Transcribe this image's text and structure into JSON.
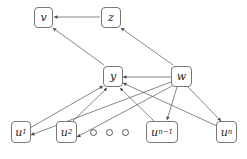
{
  "nodes": {
    "v": {
      "label": "v",
      "sub": ""
    },
    "z": {
      "label": "z",
      "sub": ""
    },
    "y": {
      "label": "y",
      "sub": ""
    },
    "w": {
      "label": "w",
      "sub": ""
    },
    "u1": {
      "label": "u",
      "sub": "1"
    },
    "u2": {
      "label": "u",
      "sub": "2"
    },
    "un1": {
      "label": "u",
      "sub": "n−1"
    },
    "un": {
      "label": "u",
      "sub": "n"
    }
  },
  "ellipsis": [
    "○",
    "○",
    "○"
  ],
  "edges": [
    {
      "from": "z",
      "to": "v"
    },
    {
      "from": "y",
      "to": "v"
    },
    {
      "from": "w",
      "to": "z"
    },
    {
      "from": "w",
      "to": "y"
    },
    {
      "from": "u1",
      "to": "y"
    },
    {
      "from": "u2",
      "to": "y"
    },
    {
      "from": "un1",
      "to": "y"
    },
    {
      "from": "un",
      "to": "y"
    },
    {
      "from": "w",
      "to": "u1"
    },
    {
      "from": "w",
      "to": "u2"
    },
    {
      "from": "w",
      "to": "un1"
    },
    {
      "from": "w",
      "to": "un"
    }
  ],
  "colors": {
    "edge": "#555555",
    "border": "#777777"
  }
}
